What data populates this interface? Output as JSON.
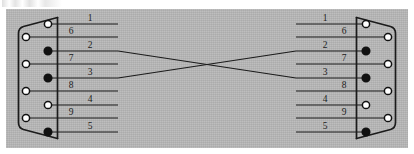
{
  "figure": {
    "background_color": "#b9b9b9",
    "page_color": "#ffffff",
    "line_color": "#1b1b1b"
  },
  "connectors": [
    {
      "id": "left-connector",
      "name": "left-db9-connector",
      "side": "left",
      "pins": [
        {
          "label": "1",
          "row": 1,
          "column": "inner",
          "filled": false
        },
        {
          "label": "6",
          "row": 2,
          "column": "outer",
          "filled": false
        },
        {
          "label": "2",
          "row": 3,
          "column": "inner",
          "filled": true
        },
        {
          "label": "7",
          "row": 4,
          "column": "outer",
          "filled": false
        },
        {
          "label": "3",
          "row": 5,
          "column": "inner",
          "filled": true
        },
        {
          "label": "8",
          "row": 6,
          "column": "outer",
          "filled": false
        },
        {
          "label": "4",
          "row": 7,
          "column": "inner",
          "filled": false
        },
        {
          "label": "9",
          "row": 8,
          "column": "outer",
          "filled": false
        },
        {
          "label": "5",
          "row": 9,
          "column": "inner",
          "filled": true
        }
      ]
    },
    {
      "id": "right-connector",
      "name": "right-db9-connector",
      "side": "right",
      "pins": [
        {
          "label": "1",
          "row": 1,
          "column": "inner",
          "filled": false
        },
        {
          "label": "6",
          "row": 2,
          "column": "outer",
          "filled": false
        },
        {
          "label": "2",
          "row": 3,
          "column": "inner",
          "filled": true
        },
        {
          "label": "7",
          "row": 4,
          "column": "outer",
          "filled": false
        },
        {
          "label": "3",
          "row": 5,
          "column": "inner",
          "filled": true
        },
        {
          "label": "8",
          "row": 6,
          "column": "outer",
          "filled": false
        },
        {
          "label": "4",
          "row": 7,
          "column": "inner",
          "filled": false
        },
        {
          "label": "9",
          "row": 8,
          "column": "outer",
          "filled": false
        },
        {
          "label": "5",
          "row": 9,
          "column": "inner",
          "filled": true
        }
      ]
    }
  ],
  "wires": [
    {
      "name": "wire-row-1",
      "from_row": 1,
      "to_row": 1,
      "crossed": false
    },
    {
      "name": "wire-row-2",
      "from_row": 2,
      "to_row": 2,
      "crossed": false
    },
    {
      "name": "wire-row-3-crossed",
      "from_row": 3,
      "to_row": 5,
      "crossed": true
    },
    {
      "name": "wire-row-4",
      "from_row": 4,
      "to_row": 4,
      "crossed": false
    },
    {
      "name": "wire-row-5-crossed",
      "from_row": 5,
      "to_row": 3,
      "crossed": true
    },
    {
      "name": "wire-row-6",
      "from_row": 6,
      "to_row": 6,
      "crossed": false
    },
    {
      "name": "wire-row-7",
      "from_row": 7,
      "to_row": 7,
      "crossed": false
    },
    {
      "name": "wire-row-8",
      "from_row": 8,
      "to_row": 8,
      "crossed": false
    },
    {
      "name": "wire-row-9",
      "from_row": 9,
      "to_row": 9,
      "crossed": false
    }
  ],
  "geometry": {
    "row_y": [
      24,
      37,
      51,
      64,
      78,
      91,
      105,
      118,
      132
    ],
    "left_inner_pin_x": 48,
    "left_outer_pin_x": 26,
    "right_inner_pin_x": 366,
    "right_outer_pin_x": 388,
    "left_stub_end_x": 118,
    "right_stub_start_x": 296,
    "cross_center_x": 207,
    "label_offset_y": -3
  }
}
